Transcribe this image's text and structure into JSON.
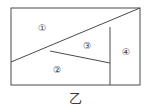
{
  "figure": {
    "caption": "乙",
    "stroke_color": "#4a4a4a",
    "text_color": "#3a3a3a",
    "background_color": "#ffffff",
    "frame": {
      "x": 11,
      "y": 8,
      "width": 129,
      "height": 77
    },
    "regions": [
      {
        "id": "region-1",
        "label": "①",
        "cx": 42,
        "cy": 28
      },
      {
        "id": "region-2",
        "label": "②",
        "cx": 57,
        "cy": 70
      },
      {
        "id": "region-3",
        "label": "③",
        "cx": 87,
        "cy": 46
      },
      {
        "id": "region-4",
        "label": "④",
        "cx": 126,
        "cy": 52
      }
    ],
    "lines": [
      {
        "id": "diagonal-line",
        "x1": 11,
        "y1": 62,
        "x2": 140,
        "y2": 8
      },
      {
        "id": "branch-line",
        "x1": 50,
        "y1": 51,
        "x2": 110,
        "y2": 63
      },
      {
        "id": "vertical-divider",
        "x1": 110,
        "y1": 27,
        "x2": 110,
        "y2": 85
      }
    ]
  }
}
